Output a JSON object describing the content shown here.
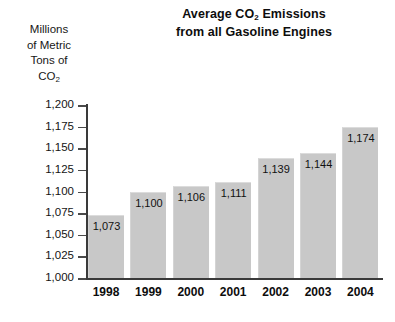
{
  "chart_data": {
    "type": "bar",
    "title": "Average CO2 Emissions from all Gasoline Engines",
    "title_lines": [
      "Average CO2 Emissions",
      "from all Gasoline Engines"
    ],
    "title_line1_pre": "Average CO",
    "title_line1_sub": "2",
    "title_line1_post": " Emissions",
    "title_line2": "from all Gasoline Engines",
    "ylabel": "Millions of Metric Tons of CO2",
    "ylabel_lines": [
      "Millions",
      "of Metric",
      "Tons of",
      "CO2"
    ],
    "ylabel_line4_pre": "CO",
    "ylabel_line4_sub": "2",
    "xlabel": "",
    "categories": [
      "1998",
      "1999",
      "2000",
      "2001",
      "2002",
      "2003",
      "2004"
    ],
    "values": [
      1073,
      1100,
      1106,
      1111,
      1139,
      1144,
      1174
    ],
    "value_labels": [
      "1,073",
      "1,100",
      "1,106",
      "1,111",
      "1,139",
      "1,144",
      "1,174"
    ],
    "ylim": [
      1000,
      1200
    ],
    "ytick_values": [
      1200,
      1175,
      1150,
      1125,
      1100,
      1075,
      1050,
      1025,
      1000
    ],
    "ytick_labels": [
      "1,200",
      "1,175",
      "1,150",
      "1,125",
      "1,100",
      "1,075",
      "1,050",
      "1,025",
      "1,000"
    ],
    "grid": false,
    "legend": false,
    "legend_position": "none",
    "bar_color": "#c8c8c8",
    "axis_color": "#3a3a3a",
    "text_color": "#141414",
    "background_color": "#ffffff"
  }
}
